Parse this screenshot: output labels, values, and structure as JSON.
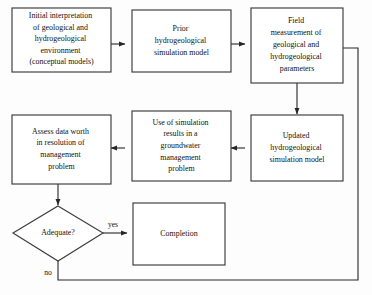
{
  "diagram": {
    "type": "flowchart",
    "colors": {
      "background": "#fdfdfd",
      "box_fill": "#ffffff",
      "box_stroke": "#3c3c3c",
      "connector": "#262626",
      "text": "#111111"
    },
    "nodes": [
      {
        "id": "initial-interpretation",
        "shape": "rectangle",
        "lines": [
          "Initial interpretation",
          "of geological and",
          "hydrogeological",
          "environment",
          "(conceptual models)"
        ]
      },
      {
        "id": "prior-model",
        "shape": "rectangle",
        "lines": [
          "Prior",
          "hydrogeological",
          "simulation model"
        ]
      },
      {
        "id": "field-measurement",
        "shape": "rectangle",
        "lines": [
          "Field",
          "measurement of",
          "geological and",
          "hydrogeological",
          "parameters"
        ]
      },
      {
        "id": "updated-model",
        "shape": "rectangle",
        "lines": [
          "Updated",
          "hydrogeological",
          "simulation model"
        ]
      },
      {
        "id": "use-of-simulation",
        "shape": "rectangle",
        "lines": [
          "Use of simulation",
          "results in a",
          "groundwater",
          "management",
          "problem"
        ]
      },
      {
        "id": "assess-data-worth",
        "shape": "rectangle",
        "lines": [
          "Assess data worth",
          "in resolution of",
          "management",
          "problem"
        ]
      },
      {
        "id": "adequate-decision",
        "shape": "diamond",
        "lines": [
          "Adequate?"
        ]
      },
      {
        "id": "completion",
        "shape": "rectangle",
        "lines": [
          "Completion"
        ]
      }
    ],
    "edge_labels": {
      "yes": "yes",
      "no": "no"
    }
  }
}
